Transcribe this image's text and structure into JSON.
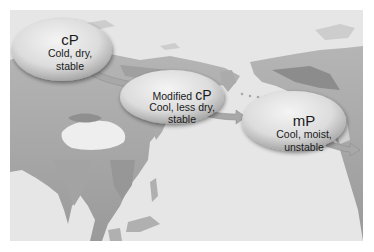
{
  "figure": {
    "region": "Asia, North Pacific Ocean, Alaska",
    "colors": {
      "background": "#ffffff",
      "ocean": "#e6e6e6",
      "land_light": "#c9c9c9",
      "land_dark": "#8e8e8e",
      "bubble_fill": "#dedede",
      "arrow": "#a8a8a8",
      "text": "#1a1a1a"
    }
  },
  "air_masses": [
    {
      "id": "cp",
      "label": "cP",
      "description": "Cold, dry, stable",
      "line1": "Cold, dry,",
      "line2": "stable"
    },
    {
      "id": "modified-cp",
      "label_prefix": "Modified",
      "label": "cP",
      "description": "Cool, less dry, stable",
      "line1": "Cool, less dry,",
      "line2": "stable"
    },
    {
      "id": "mp",
      "label": "mP",
      "description": "Cool, moist, unstable",
      "line1": "Cool, moist,",
      "line2": "unstable"
    }
  ],
  "arrows": [
    {
      "from": "cp",
      "to": "modified-cp",
      "direction": "southeast"
    },
    {
      "from": "modified-cp",
      "to": "mp",
      "direction": "east-southeast"
    },
    {
      "from": "mp",
      "to": "north-america-coast",
      "direction": "east"
    }
  ]
}
